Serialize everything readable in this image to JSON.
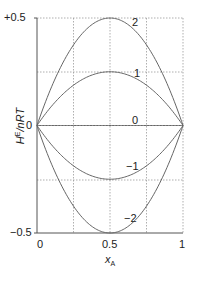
{
  "chart_data": {
    "type": "line",
    "title": "",
    "xlabel": "x_A",
    "ylabel": "H^E/nRT",
    "xlim": [
      0,
      1
    ],
    "ylim": [
      -0.5,
      0.5
    ],
    "grid": true,
    "x_ticks": [
      "0",
      "0.5",
      "1"
    ],
    "y_ticks": [
      "+0.5",
      "0",
      "−0.5"
    ],
    "gridlines_x": [
      0.25,
      0.5,
      0.75
    ],
    "gridlines_y": [
      0.25,
      -0.25
    ],
    "formula": "y = beta * x * (1 - x)",
    "x": [
      0,
      0.1,
      0.2,
      0.3,
      0.4,
      0.5,
      0.6,
      0.7,
      0.8,
      0.9,
      1.0
    ],
    "series": [
      {
        "name": "2",
        "beta": 2,
        "values": [
          0,
          0.18,
          0.32,
          0.42,
          0.48,
          0.5,
          0.48,
          0.42,
          0.32,
          0.18,
          0
        ]
      },
      {
        "name": "1",
        "beta": 1,
        "values": [
          0,
          0.09,
          0.16,
          0.21,
          0.24,
          0.25,
          0.24,
          0.21,
          0.16,
          0.09,
          0
        ]
      },
      {
        "name": "0",
        "beta": 0,
        "values": [
          0,
          0,
          0,
          0,
          0,
          0,
          0,
          0,
          0,
          0,
          0
        ]
      },
      {
        "name": "−1",
        "beta": -1,
        "values": [
          0,
          -0.09,
          -0.16,
          -0.21,
          -0.24,
          -0.25,
          -0.24,
          -0.21,
          -0.16,
          -0.09,
          0
        ]
      },
      {
        "name": "−2",
        "beta": -2,
        "values": [
          0,
          -0.18,
          -0.32,
          -0.42,
          -0.48,
          -0.5,
          -0.48,
          -0.42,
          -0.32,
          -0.18,
          0
        ]
      }
    ],
    "legend": "inline curve labels"
  },
  "axes": {
    "ylabel_main": "H",
    "ylabel_sup": "E",
    "ylabel_rest": "/nRT",
    "xlabel_main": "x",
    "xlabel_sub": "A",
    "y_tick_top": "+0.5",
    "y_tick_mid": "0",
    "y_tick_bottom": "−0.5",
    "x_tick_left": "0",
    "x_tick_mid": "0.5",
    "x_tick_right": "1"
  },
  "labels": {
    "b2": "2",
    "b1": "1",
    "b0": "0",
    "bm1": "−1",
    "bm2": "−2"
  },
  "colors": {
    "curve": "#666666",
    "axis": "#555555",
    "grid": "#999999"
  }
}
